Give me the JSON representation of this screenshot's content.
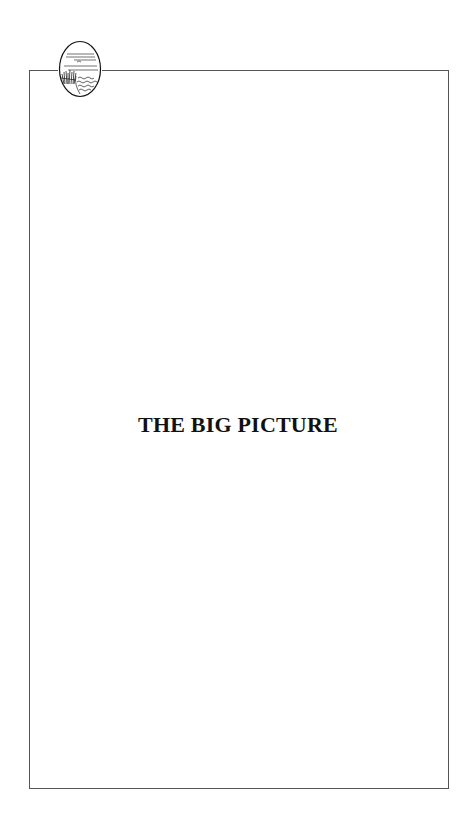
{
  "page": {
    "title": "THE BIG PICTURE",
    "emblem_icon": "landscape-oval-icon",
    "colors": {
      "border": "#555555",
      "text": "#111111",
      "background": "#ffffff"
    }
  }
}
